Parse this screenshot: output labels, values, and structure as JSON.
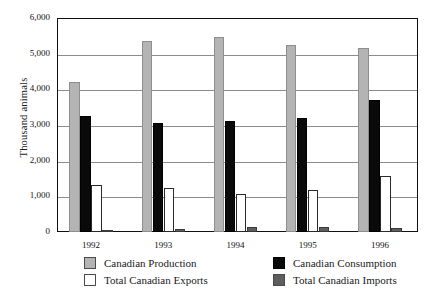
{
  "figure": {
    "title_remnant": "",
    "axis": {
      "ylabel": "Thousand animals",
      "yticks": [
        "6,000",
        "5,000",
        "4,000",
        "3,000",
        "2,000",
        "1,000",
        "0"
      ],
      "xticks": [
        "1992",
        "1993",
        "1994",
        "1995",
        "1996"
      ]
    },
    "legend": [
      {
        "label": "Canadian Production",
        "swatch": "production"
      },
      {
        "label": "Canadian Consumption",
        "swatch": "consumption"
      },
      {
        "label": "Total Canadian Exports",
        "swatch": "exports"
      },
      {
        "label": "Total Canadian Imports",
        "swatch": "imports"
      }
    ]
  },
  "colors": {
    "production": "#b4b4b4",
    "consumption": "#0a0a0a",
    "exports": "#ffffff",
    "imports": "#5e5e5e",
    "axis": "#111111",
    "grid": "#8c8c8c"
  },
  "chart_data": {
    "type": "bar",
    "title": "",
    "xlabel": "",
    "ylabel": "Thousand animals",
    "categories": [
      "1992",
      "1993",
      "1994",
      "1995",
      "1996"
    ],
    "ylim": [
      0,
      6000
    ],
    "ytick_step": 1000,
    "grid": true,
    "legend_position": "bottom",
    "series": [
      {
        "name": "Canadian Production",
        "values": [
          4200,
          5360,
          5470,
          5250,
          5170
        ]
      },
      {
        "name": "Canadian Consumption",
        "values": [
          3250,
          3060,
          3120,
          3200,
          3690
        ]
      },
      {
        "name": "Total Canadian Exports",
        "values": [
          1320,
          1240,
          1060,
          1180,
          1580
        ]
      },
      {
        "name": "Total Canadian Imports",
        "values": [
          40,
          90,
          140,
          150,
          100
        ]
      }
    ]
  }
}
